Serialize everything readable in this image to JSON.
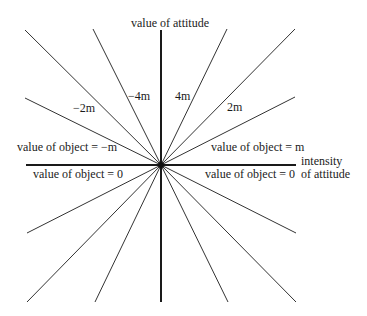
{
  "diagram": {
    "axes": {
      "vertical_label": "value of attitude",
      "horizontal_label_line1": "intensity",
      "horizontal_label_line2": "of attitude"
    },
    "ray_labels": {
      "neg_4m": "−4m",
      "pos_4m": "4m",
      "neg_2m": "−2m",
      "pos_2m": "2m",
      "neg_m": "value of object = −m",
      "pos_m": "value of object = m",
      "zero_left": "value of object = 0",
      "zero_right": "value of object = 0"
    },
    "colors": {
      "line": "#2a2a2a",
      "axis": "#1a1a1a",
      "background": "#ffffff"
    }
  }
}
